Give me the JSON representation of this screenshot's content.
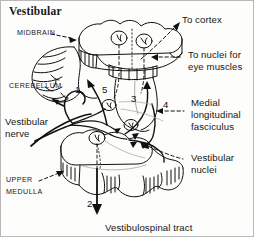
{
  "figure": {
    "title": "Vestibular",
    "background_color": "#fdfdfb",
    "line_color": "#101010",
    "border_color": "#b8b8b8"
  },
  "labels": {
    "midbrain": "MIDBRAIN",
    "cerebellum": "CEREBELLUM",
    "vestibular_nerve_line1": "Vestibular",
    "vestibular_nerve_line2": "nerve",
    "upper_line1": "UPPER",
    "upper_line2": "MEDULLA",
    "to_cortex": "To cortex",
    "to_nuclei_line1": "To nuclei for",
    "to_nuclei_line2": "eye muscles",
    "mlf_line1": "Medial",
    "mlf_line2": "longitudinal",
    "mlf_line3": "fasciculus",
    "vestibular_nuclei_line1": "Vestibular",
    "vestibular_nuclei_line2": "nuclei",
    "vestibulospinal_tract": "Vestibulospinal tract"
  },
  "pathway_numbers": {
    "one": "1",
    "two": "2",
    "three": "3",
    "four": "4",
    "five": "5"
  },
  "icons": {
    "leader_arrow": "dashed-leader-arrow-icon",
    "pathway_arrow": "solid-pathway-arrow-icon",
    "brainstem": "brainstem-outline-icon",
    "cerebellum": "cerebellum-outline-icon"
  }
}
